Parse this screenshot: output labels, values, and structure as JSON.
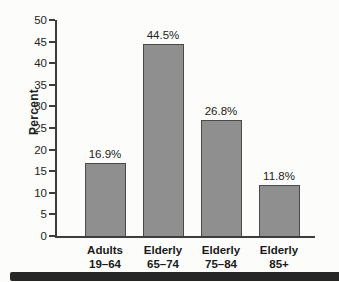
{
  "chart_data": {
    "type": "bar",
    "categories": [
      "Adults\n19–64",
      "Elderly\n65–74",
      "Elderly\n75–84",
      "Elderly\n85+"
    ],
    "values": [
      16.9,
      44.5,
      26.8,
      11.8
    ],
    "value_labels": [
      "16.9%",
      "44.5%",
      "26.8%",
      "11.8%"
    ],
    "title": "",
    "xlabel": "",
    "ylabel": "Percent",
    "ylim": [
      0,
      50
    ],
    "ytick_step": 5,
    "grid": "off",
    "legend": "none",
    "bar_fill_color": "#8f8f8f",
    "bar_border_color": "#4a4a4a",
    "axis_color": "#3d3d3d"
  }
}
